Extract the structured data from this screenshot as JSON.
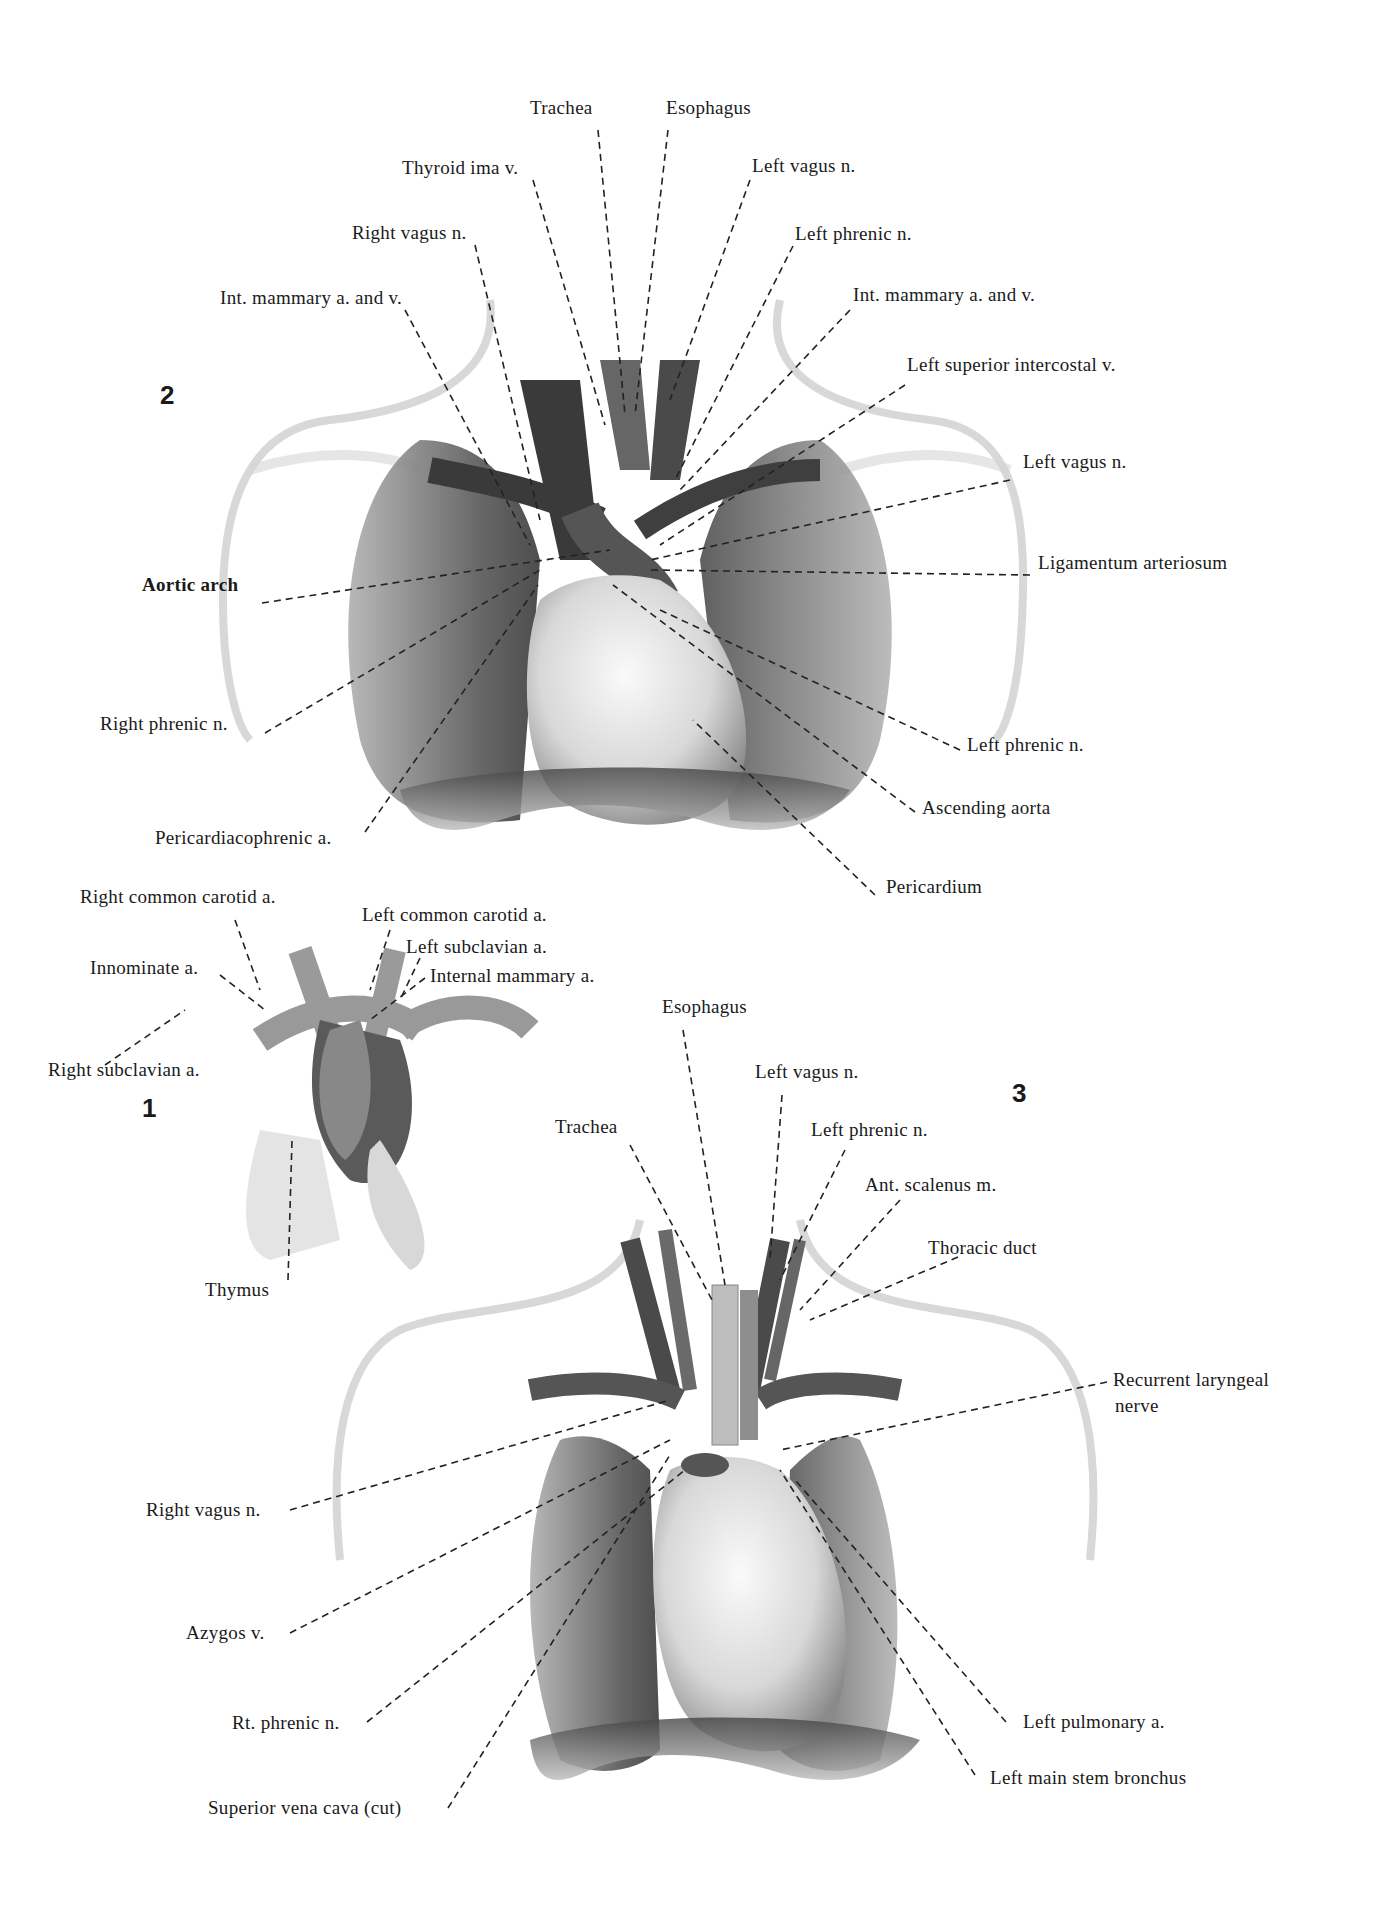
{
  "figures": [
    {
      "number": "2",
      "labels": {
        "trachea": "Trachea",
        "esophagus": "Esophagus",
        "thyroid_ima_v": "Thyroid ima v.",
        "left_vagus_top": "Left vagus n.",
        "right_vagus": "Right vagus n.",
        "left_phrenic_top": "Left phrenic n.",
        "int_mammary_right": "Int. mammary a. and v.",
        "int_mammary_left": "Int. mammary a. and v.",
        "left_superior_intercostal_v": "Left superior intercostal v.",
        "left_vagus_mid": "Left vagus n.",
        "aortic_arch": "Aortic arch",
        "ligamentum_arteriosum": "Ligamentum arteriosum",
        "right_phrenic": "Right phrenic n.",
        "left_phrenic_low": "Left phrenic n.",
        "ascending_aorta": "Ascending aorta",
        "pericardiacophrenic_a": "Pericardiacophrenic a.",
        "pericardium": "Pericardium"
      }
    },
    {
      "number": "1",
      "labels": {
        "right_common_carotid": "Right common carotid a.",
        "left_common_carotid": "Left common carotid a.",
        "innominate": "Innominate a.",
        "left_subclavian": "Left subclavian a.",
        "internal_mammary": "Internal mammary a.",
        "right_subclavian": "Right subclavian a.",
        "thymus": "Thymus"
      }
    },
    {
      "number": "3",
      "labels": {
        "esophagus": "Esophagus",
        "left_vagus": "Left vagus n.",
        "trachea": "Trachea",
        "left_phrenic": "Left phrenic n.",
        "ant_scalenus": "Ant. scalenus m.",
        "thoracic_duct": "Thoracic duct",
        "recurrent_laryngeal_1": "Recurrent laryngeal",
        "recurrent_laryngeal_2": "nerve",
        "right_vagus": "Right vagus n.",
        "azygos_v": "Azygos v.",
        "rt_phrenic": "Rt. phrenic n.",
        "left_pulmonary_a": "Left pulmonary a.",
        "left_main_stem_bronchus": "Left main stem bronchus",
        "superior_vena_cava": "Superior vena cava (cut)"
      }
    }
  ],
  "colors": {
    "ink": "#1a1a1a",
    "skin_outline": "#c8c8c8",
    "lung_dark": "#5a5a5a",
    "vessel_dark": "#3a3a3a",
    "heart_light": "#e6e6e6"
  }
}
